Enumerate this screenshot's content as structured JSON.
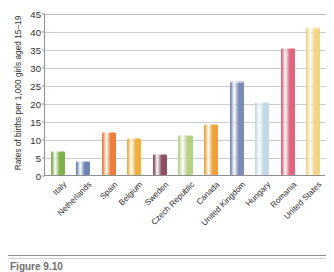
{
  "chart_data": {
    "type": "bar",
    "title": "",
    "xlabel": "",
    "ylabel": "Rates of births per 1,000 girls aged 15–19",
    "ylim": [
      0,
      45
    ],
    "yticks": [
      0,
      5,
      10,
      15,
      20,
      25,
      30,
      35,
      40,
      45
    ],
    "grid": true,
    "legend": "none",
    "categories": [
      "Italy",
      "Netherlands",
      "Spain",
      "Belgium",
      "Sweden",
      "Czech Republic",
      "Canada",
      "United Kingdom",
      "Hungary",
      "Romania",
      "United States"
    ],
    "values": [
      6.7,
      3.9,
      12.0,
      10.2,
      5.9,
      11.1,
      14.2,
      26.0,
      20.4,
      35.2,
      41.0
    ],
    "colors": [
      "#7fb04a",
      "#6b85b8",
      "#ed7d3a",
      "#f0ae3f",
      "#8c4f63",
      "#b7d287",
      "#f0a13c",
      "#7b8bb5",
      "#c3d9e6",
      "#dd667e",
      "#f2d487"
    ]
  },
  "caption": {
    "label": "Figure 9.10"
  }
}
